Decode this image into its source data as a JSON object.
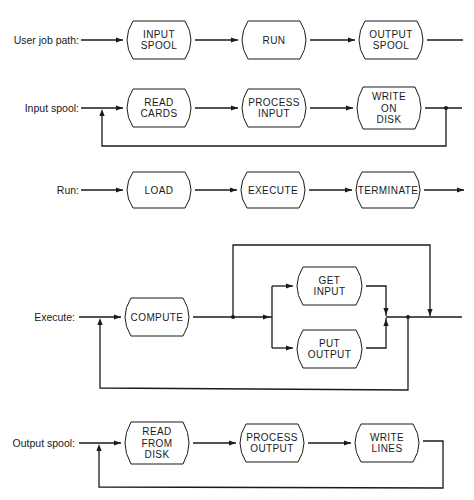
{
  "diagram": {
    "rows": [
      {
        "id": "user-job-path",
        "label": "User job path:",
        "nodes": [
          {
            "id": "input-spool",
            "lines": [
              "INPUT",
              "SPOOL"
            ]
          },
          {
            "id": "run",
            "lines": [
              "RUN"
            ]
          },
          {
            "id": "output-spool",
            "lines": [
              "OUTPUT",
              "SPOOL"
            ]
          }
        ],
        "loop_back": false
      },
      {
        "id": "input-spool",
        "label": "Input spool:",
        "nodes": [
          {
            "id": "read-cards",
            "lines": [
              "READ",
              "CARDS"
            ]
          },
          {
            "id": "process-input",
            "lines": [
              "PROCESS",
              "INPUT"
            ]
          },
          {
            "id": "write-on-disk",
            "lines": [
              "WRITE",
              "ON",
              "DISK"
            ]
          }
        ],
        "loop_back": true
      },
      {
        "id": "run",
        "label": "Run:",
        "nodes": [
          {
            "id": "load",
            "lines": [
              "LOAD"
            ]
          },
          {
            "id": "execute",
            "lines": [
              "EXECUTE"
            ]
          },
          {
            "id": "terminate",
            "lines": [
              "TERMINATE"
            ]
          }
        ],
        "loop_back": false
      },
      {
        "id": "execute",
        "label": "Execute:",
        "nodes": [
          {
            "id": "compute",
            "lines": [
              "COMPUTE"
            ]
          },
          {
            "id": "get-input",
            "lines": [
              "GET",
              "INPUT"
            ]
          },
          {
            "id": "put-output",
            "lines": [
              "PUT",
              "OUTPUT"
            ]
          }
        ],
        "loop_back": true,
        "bypass": true
      },
      {
        "id": "output-spool",
        "label": "Output spool:",
        "nodes": [
          {
            "id": "read-from-disk",
            "lines": [
              "READ",
              "FROM",
              "DISK"
            ]
          },
          {
            "id": "process-output",
            "lines": [
              "PROCESS",
              "OUTPUT"
            ]
          },
          {
            "id": "write-lines",
            "lines": [
              "WRITE",
              "LINES"
            ]
          }
        ],
        "loop_back": true
      }
    ]
  }
}
